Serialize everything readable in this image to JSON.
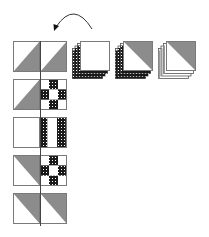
{
  "canvas": {
    "width": 209,
    "height": 237,
    "background": "#ffffff"
  },
  "colors": {
    "outline": "#7a7a7a",
    "shade": "#8c8c8c",
    "check_dark": "#1a1a1a",
    "check_light": "#ffffff",
    "white": "#ffffff",
    "arrow": "#333333",
    "layer_dark": "#555555",
    "layer_mid": "#9a9a9a"
  },
  "arrow": {
    "description": "curved rotation arrow, counter-clockwise",
    "start": [
      92,
      29
    ],
    "control": [
      74,
      0
    ],
    "end": [
      56,
      27
    ],
    "head_direction": "down-left"
  },
  "center_line": {
    "x": 40,
    "y1": 41,
    "y2": 226
  },
  "block_column": {
    "x": 13,
    "cell": 27,
    "height": 31,
    "rows": [
      {
        "id": "row-1",
        "y": 41,
        "left": "hst-bottom-right",
        "right": "hst-bottom-right"
      },
      {
        "id": "row-2",
        "y": 79,
        "left": "hst-bottom-right",
        "right": "nine-patch-checked-cross"
      },
      {
        "id": "row-3",
        "y": 117,
        "left": "plain",
        "right": "two-vertical-checked-stripes"
      },
      {
        "id": "row-4",
        "y": 155,
        "left": "hst-top-right",
        "right": "nine-patch-checked-cross"
      },
      {
        "id": "row-5",
        "y": 193,
        "left": "hst-top-right",
        "right": "hst-top-right"
      }
    ]
  },
  "stacks": [
    {
      "id": "stack-plain",
      "x": 80,
      "y": 41,
      "size": 30,
      "top": "plain",
      "layers": 4,
      "checked_edges": true
    },
    {
      "id": "stack-hst-checked",
      "x": 123,
      "y": 41,
      "size": 30,
      "top": "hst-top-right",
      "layers": 4,
      "checked_edges": true
    },
    {
      "id": "stack-hst-plain",
      "x": 166,
      "y": 41,
      "size": 30,
      "top": "hst-top-right",
      "layers": 4,
      "checked_edges": false
    }
  ]
}
